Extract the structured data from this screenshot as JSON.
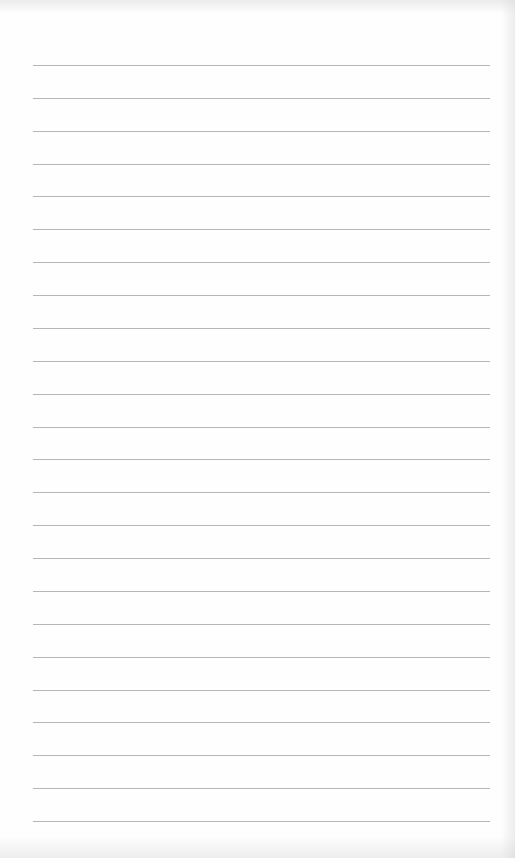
{
  "sheet": {
    "type": "lined-paper",
    "line_count": 24,
    "first_line_y": 65,
    "last_line_y": 821,
    "line_left_x": 33,
    "line_right_x": 490,
    "line_color": "#a9a9a9",
    "background_color": "#fefefe"
  }
}
